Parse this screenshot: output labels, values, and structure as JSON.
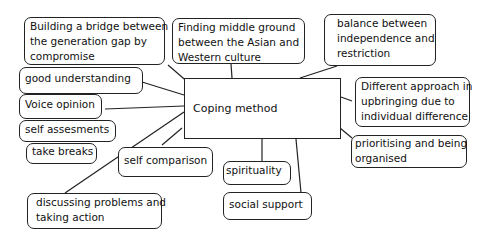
{
  "diagram": {
    "center": {
      "label": "Coping method"
    },
    "nodes": [
      {
        "id": "bridge",
        "lines": [
          "Building a bridge between",
          "the generation gap by",
          "compromise"
        ]
      },
      {
        "id": "middle",
        "lines": [
          "Finding middle ground",
          "between the Asian and",
          "Western culture"
        ]
      },
      {
        "id": "balance",
        "lines": [
          "balance between",
          "independence and",
          "restriction"
        ]
      },
      {
        "id": "understanding",
        "lines": [
          "good understanding"
        ]
      },
      {
        "id": "voice",
        "lines": [
          "Voice opinion"
        ]
      },
      {
        "id": "different",
        "lines": [
          "Different approach in",
          "upbringing due to",
          "individual difference"
        ]
      },
      {
        "id": "assess",
        "lines": [
          "self assesments"
        ]
      },
      {
        "id": "breaks",
        "lines": [
          "take breaks"
        ]
      },
      {
        "id": "comparison",
        "lines": [
          "self comparison"
        ]
      },
      {
        "id": "spirituality",
        "lines": [
          "spirituality"
        ]
      },
      {
        "id": "prioritising",
        "lines": [
          "prioritising and being",
          "organised"
        ]
      },
      {
        "id": "social",
        "lines": [
          "social support"
        ]
      },
      {
        "id": "discussing",
        "lines": [
          "discussing problems and",
          "taking action"
        ]
      }
    ]
  },
  "colors": {
    "line": "#222222",
    "background": "#ffffff"
  }
}
